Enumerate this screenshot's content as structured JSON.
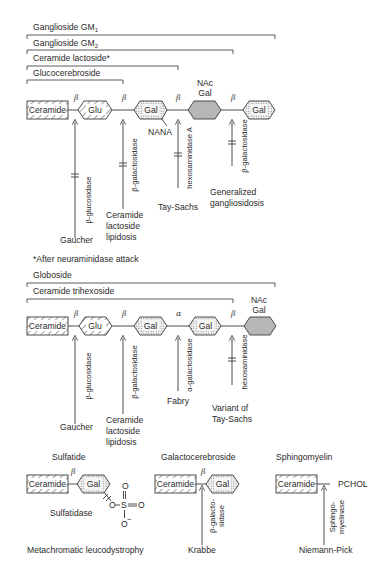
{
  "colors": {
    "ink": "#2a2a2a",
    "line": "#3a3a3a",
    "dotted_fill": "#ececec",
    "solid_hex_fill": "#bdbdbd",
    "background": "#ffffff"
  },
  "top_pathway": {
    "brackets": [
      {
        "label": "Ganglioside GM",
        "sub": "1"
      },
      {
        "label": "Ganglioside GM",
        "sub": "2"
      },
      {
        "label": "Ceramide lactoside*"
      },
      {
        "label": "Glucocerebroside"
      }
    ],
    "chain": {
      "nodes": [
        "Ceramide",
        "Glu",
        "Gal",
        "NAc Gal",
        "Gal"
      ],
      "nac_line1": "NAc",
      "nac_line2": "Gal",
      "branch": "NANA",
      "linkages": [
        "β",
        "β",
        "β",
        "β"
      ]
    },
    "enzymes": [
      {
        "enzyme": "β-glucosidase",
        "disease": [
          "Gaucher"
        ]
      },
      {
        "enzyme": "β-galactosidase",
        "disease": [
          "Ceramide",
          "lactoside",
          "lipidosis"
        ]
      },
      {
        "enzyme": "hexosaminidase A",
        "disease": [
          "Tay-Sachs"
        ]
      },
      {
        "enzyme": "β-galactosidase",
        "disease": [
          "Generalized",
          "gangliosidosis"
        ]
      }
    ],
    "footnote": "*After neuraminidase attack"
  },
  "middle_pathway": {
    "brackets": [
      {
        "label": "Globoside"
      },
      {
        "label": "Ceramide trihexoside"
      }
    ],
    "chain": {
      "nodes": [
        "Ceramide",
        "Glu",
        "Gal",
        "Gal",
        "NAc Gal"
      ],
      "nac_line1": "NAc",
      "nac_line2": "Gal",
      "linkages": [
        "β",
        "β",
        "α",
        "β"
      ]
    },
    "enzymes": [
      {
        "enzyme": "β-glucosidase",
        "disease": [
          "Gaucher"
        ]
      },
      {
        "enzyme": "β-galactosidase",
        "disease": [
          "Ceramide",
          "lactoside",
          "lipidosis"
        ]
      },
      {
        "enzyme": "α-galactosidase",
        "disease": [
          "Fabry"
        ]
      },
      {
        "enzyme": "hexosaminidase",
        "disease": [
          "Variant of",
          "Tay-Sachs"
        ]
      }
    ]
  },
  "bottom_panels": [
    {
      "title": "Sulfatide",
      "nodes": [
        "Ceramide",
        "Gal"
      ],
      "linkage": "β",
      "sulfate": {
        "o_top": "O",
        "o_left": "O",
        "s": "S",
        "o_right": "O",
        "o_bottom": "O",
        "charge": "−"
      },
      "enzyme": "Sulfatidase",
      "disease": "Metachromatic leucodystrophy"
    },
    {
      "title": "Galactocerebroside",
      "nodes": [
        "Ceramide",
        "Gal"
      ],
      "linkage": "β",
      "enzyme_line1": "β-galacto-",
      "enzyme_line2": "sidase",
      "disease": "Krabbe"
    },
    {
      "title": "Sphingomyelin",
      "nodes": [
        "Ceramide"
      ],
      "group": "PCHOL",
      "enzyme_line1": "Sphingo-",
      "enzyme_line2": "myelinase",
      "disease": "Niemann-Pick"
    }
  ]
}
